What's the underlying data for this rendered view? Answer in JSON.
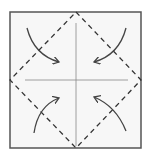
{
  "diagram": {
    "type": "origami-fold-diagram",
    "colors": {
      "paper": "#f7f7f7",
      "frame": "#555555",
      "crease": "#777777",
      "fold_line": "#333333",
      "arrow": "#444444"
    },
    "square": {
      "x": 10,
      "y": 12,
      "w": 131,
      "h": 136
    },
    "center": {
      "x": 76,
      "y": 80
    },
    "fold_lines": [
      "top-left",
      "top-right",
      "bottom-right",
      "bottom-left"
    ],
    "arrows": [
      "top-left-to-center",
      "top-right-to-center",
      "bottom-left-to-center",
      "bottom-right-to-center"
    ]
  }
}
